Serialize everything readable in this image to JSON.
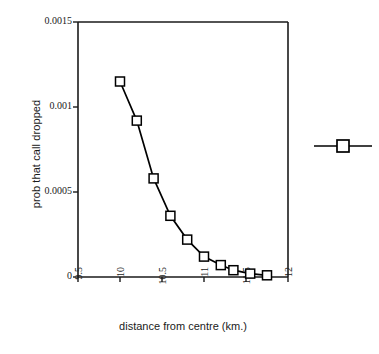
{
  "chart_data": {
    "type": "line",
    "title": "",
    "xlabel": "distance from centre (km.)",
    "ylabel": "prob that call dropped",
    "xlim": [
      9.5,
      12
    ],
    "ylim": [
      0,
      0.0015
    ],
    "xticks": [
      "9.5",
      "10",
      "10.5",
      "11",
      "11.5",
      "12"
    ],
    "xtick_values": [
      9.5,
      10,
      10.5,
      11,
      11.5,
      12
    ],
    "yticks": [
      "0",
      "0.0005",
      "0.001",
      "0.0015"
    ],
    "ytick_values": [
      0,
      0.0005,
      0.001,
      0.0015
    ],
    "grid": false,
    "legend_position": "right-outside",
    "marker": "open-square",
    "line_color": "#000000",
    "marker_color": "#000000",
    "marker_fill": "#ffffff",
    "series": [
      {
        "name": "",
        "x": [
          10.0,
          10.2,
          10.4,
          10.6,
          10.8,
          11.0,
          11.2,
          11.35,
          11.55,
          11.75
        ],
        "values": [
          0.00115,
          0.00092,
          0.00058,
          0.00036,
          0.00022,
          0.00012,
          7e-05,
          4e-05,
          2e-05,
          1e-05
        ]
      }
    ]
  },
  "legend": {
    "entries": [
      {
        "label": "",
        "marker": "open-square",
        "color": "#000000"
      }
    ]
  }
}
